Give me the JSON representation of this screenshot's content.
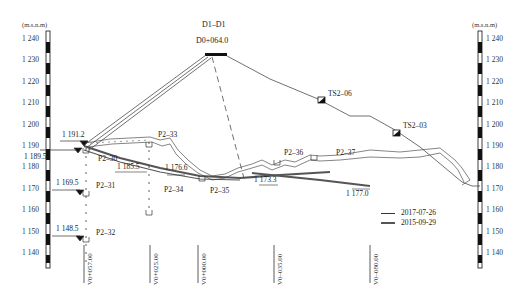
{
  "title": "D1–D1",
  "subtitle": "D0+064.0",
  "axis": {
    "unit_left": "(m.s.n.m)",
    "unit_right": "(m.s.n.m)",
    "ticks": [
      "1 240",
      "1 230",
      "1 220",
      "1 210",
      "1 200",
      "1 190",
      "1 180",
      "1 170",
      "1 160",
      "1 150",
      "1 140"
    ]
  },
  "elevation_labels": [
    {
      "id": "e1",
      "text": "1 191.2"
    },
    {
      "id": "e2",
      "text": "1 189.5"
    },
    {
      "id": "e3",
      "text": "1 169.5"
    },
    {
      "id": "e4",
      "text": "1 148.5"
    },
    {
      "id": "e5",
      "text": "1 185.5"
    },
    {
      "id": "e6",
      "text": "1 176.6"
    },
    {
      "id": "e7",
      "text": "1 173.3"
    },
    {
      "id": "e8",
      "text": "1 177.0"
    }
  ],
  "points": [
    {
      "id": "p30",
      "text": "P2–30"
    },
    {
      "id": "p31",
      "text": "P2–31"
    },
    {
      "id": "p32",
      "text": "P2–32"
    },
    {
      "id": "p33",
      "text": "P2–33"
    },
    {
      "id": "p34",
      "text": "P2–34"
    },
    {
      "id": "p35",
      "text": "P2–35"
    },
    {
      "id": "p36",
      "text": "P2–36"
    },
    {
      "id": "p37",
      "text": "P2–37"
    },
    {
      "id": "ts06",
      "text": "TS2–06"
    },
    {
      "id": "ts03",
      "text": "TS2–03"
    }
  ],
  "stations": [
    "V0+057.00",
    "V0+025.00",
    "V0+000.00",
    "V0–035.00",
    "V0–080.00"
  ],
  "legend": [
    {
      "label": "2017-07-26",
      "color": "#333333"
    },
    {
      "label": "2015-09-29",
      "color": "#555555"
    }
  ]
}
